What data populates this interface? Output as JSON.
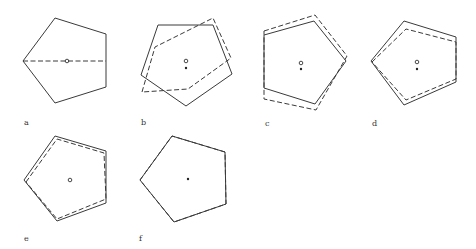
{
  "figure": {
    "panels": [
      {
        "label": "a",
        "label_pos": [
          24,
          118
        ],
        "solid": "23,61 55,18 106,34 106,87 55,103",
        "dashed_line": "23,61 106,61",
        "center_circle": [
          67,
          61
        ],
        "center_dot": null
      },
      {
        "label": "b",
        "label_pos": [
          141,
          118
        ],
        "solid": "158,25 213,25 232,74 186,106 141,75",
        "dashed": "142,92 155,47 213,18 231,58 188,89",
        "center_circle": [
          186,
          61
        ],
        "center_dot": [
          186,
          68
        ]
      },
      {
        "label": "c",
        "label_pos": [
          265,
          119
        ],
        "solid": "264,35 314,21 346,61 315,104 264,88",
        "dashed": "264,31 315,15 347,56 316,110 264,99",
        "center_circle": [
          301,
          63
        ],
        "center_dot": [
          301,
          69
        ]
      },
      {
        "label": "d",
        "label_pos": [
          372,
          119
        ],
        "solid": "371,61 404,21 456,37 456,82 404,105",
        "dashed": "372,62 406,29 456,42 456,79 406,100",
        "center_circle": [
          417,
          62
        ],
        "center_dot": [
          417,
          69
        ]
      },
      {
        "label": "e",
        "label_pos": [
          24,
          234
        ],
        "solid": "24,180 55,136 106,151 106,203 57,221",
        "dashed": "26,182 57,139 104,153 106,199 57,219",
        "center_circle": [
          70,
          180
        ],
        "center_dot": null
      },
      {
        "label": "f",
        "label_pos": [
          139,
          234
        ],
        "solid": "140,180 172,136 225,152 226,204 174,222",
        "dashed": "140,180 172,136 225,152 226,204 174,222",
        "center_circle": null,
        "center_dot": [
          188,
          179
        ]
      }
    ]
  }
}
